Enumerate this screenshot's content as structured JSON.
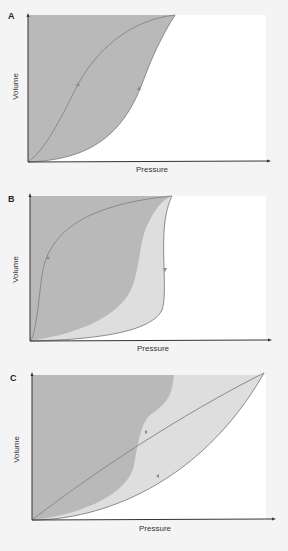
{
  "colors": {
    "background": "#f4f4f4",
    "plot_area": "#ffffff",
    "dark_fill": "#b9b9b9",
    "light_fill": "#dedede",
    "curve": "#8a8a8a",
    "axis": "#333333"
  },
  "panels": [
    {
      "letter": "A",
      "xlabel": "Pressure",
      "ylabel": "Volume",
      "description": "Hysteresis loop: inflation and deflation curves enclosing a large shaded area"
    },
    {
      "letter": "B",
      "xlabel": "Pressure",
      "ylabel": "Volume",
      "description": "Loop with wider separation; light shaded band added between curves"
    },
    {
      "letter": "C",
      "xlabel": "Pressure",
      "ylabel": "Volume",
      "description": "Narrow, elongated loop to higher pressure; dark and light shaded regions"
    }
  ]
}
